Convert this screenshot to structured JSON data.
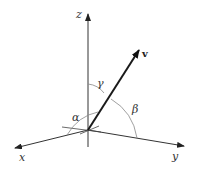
{
  "diagram": {
    "labels": {
      "z_axis": "z",
      "x_axis": "x",
      "y_axis": "y",
      "vector": "v",
      "alpha": "α",
      "beta": "β",
      "gamma": "γ"
    },
    "colors": {
      "background": "#ffffff",
      "axis": "#333333",
      "vector": "#1a1a1a",
      "arc": "#888888"
    }
  }
}
